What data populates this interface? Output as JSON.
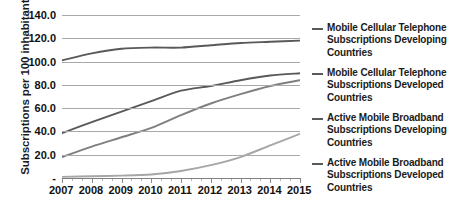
{
  "chart_data": {
    "type": "line",
    "title": "",
    "xlabel": "",
    "ylabel": "Subscriptions per 100 inhabitants",
    "x": [
      2007,
      2008,
      2009,
      2010,
      2011,
      2012,
      2013,
      2014,
      2015
    ],
    "xtick_labels": [
      "2007",
      "2008",
      "2009",
      "2010",
      "2011",
      "2012",
      "2013",
      "2014",
      "2015"
    ],
    "ytick_labels": [
      "140.0",
      "120.0",
      "100.0",
      "80.0",
      "60.0",
      "40.0",
      "20.0",
      "-"
    ],
    "ytick_values": [
      140,
      120,
      100,
      80,
      60,
      40,
      20,
      0
    ],
    "ylim": [
      0,
      140
    ],
    "grid": true,
    "legend_position": "right",
    "series": [
      {
        "name": "Mobile Cellular Telephone Subscriptions Developing Countries",
        "color": "#595959",
        "values": [
          101,
          107,
          111,
          112,
          112,
          114,
          116,
          117,
          118
        ]
      },
      {
        "name": "Mobile Cellular Telephone Subscriptions Developed Countries",
        "color": "#595959",
        "values": [
          38.5,
          48,
          57,
          66,
          75,
          79,
          84,
          88,
          90
        ]
      },
      {
        "name": "Active Mobile Broadband Subscriptions Developing Countries",
        "color": "#7f7f7f",
        "values": [
          18,
          27,
          35,
          43,
          54,
          64,
          72,
          79,
          84
        ]
      },
      {
        "name": "Active Mobile Broadband Subscriptions Developed Countries",
        "color": "#a6a6a6",
        "values": [
          1,
          1.5,
          2,
          3,
          6,
          11,
          18,
          28,
          38
        ]
      }
    ]
  },
  "legend": {
    "items": [
      {
        "lines": [
          "Mobile Cellular Telephone",
          "Subscriptions Developing",
          "Countries"
        ],
        "color": "#595959"
      },
      {
        "lines": [
          "Mobile Cellular Telephone",
          "Subscriptions Developed",
          "Countries"
        ],
        "color": "#595959"
      },
      {
        "lines": [
          "Active Mobile Broadband",
          "Subscriptions Developing",
          "Countries"
        ],
        "color": "#595959"
      },
      {
        "lines": [
          "Active Mobile Broadband",
          "Subscriptions Developed",
          "Countries"
        ],
        "color": "#595959"
      }
    ]
  }
}
